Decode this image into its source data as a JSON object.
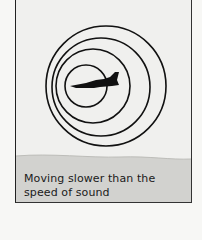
{
  "diagram": {
    "caption_line1": "Moving slower than the",
    "caption_line2": "speed of sound",
    "caption": "Moving slower than the speed of sound",
    "wavefronts": [
      {
        "cx": 106,
        "cy": 86,
        "r": 60
      },
      {
        "cx": 101,
        "cy": 87,
        "r": 49
      },
      {
        "cx": 93,
        "cy": 86,
        "r": 37
      },
      {
        "cx": 86,
        "cy": 86,
        "r": 21
      }
    ],
    "colors": {
      "sky": "#f0f0ee",
      "ground": "#d2d2cf",
      "ink": "#111111"
    }
  }
}
